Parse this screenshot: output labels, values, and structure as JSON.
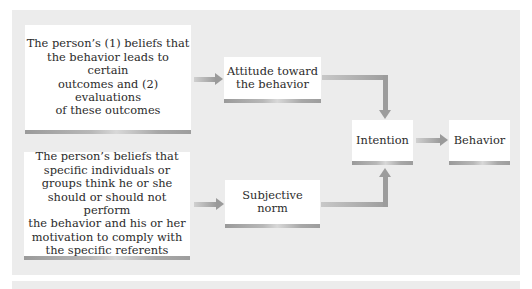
{
  "diagram": {
    "nodes": [
      {
        "id": "beliefs_outcomes",
        "label": "The person’s (1) beliefs that the behavior leads to certain outcomes and (2) evaluations of these outcomes"
      },
      {
        "id": "normative_beliefs",
        "label": "The person’s beliefs that specific individuals or groups think he or she should or should not perform the behavior and his or her motivation to comply with the specific referents"
      },
      {
        "id": "attitude",
        "label": "Attitude toward the behavior"
      },
      {
        "id": "subjective_norm",
        "label": "Subjective norm"
      },
      {
        "id": "intention",
        "label": "Intention"
      },
      {
        "id": "behavior",
        "label": "Behavior"
      }
    ],
    "edges": [
      {
        "from": "beliefs_outcomes",
        "to": "attitude"
      },
      {
        "from": "normative_beliefs",
        "to": "subjective_norm"
      },
      {
        "from": "attitude",
        "to": "intention"
      },
      {
        "from": "subjective_norm",
        "to": "intention"
      },
      {
        "from": "intention",
        "to": "behavior"
      }
    ]
  },
  "labels": {
    "box1": "The person’s (1) beliefs that the behavior leads to certain outcomes and (2) evaluations of these outcomes",
    "box1_lines": [
      "The person’s (1) beliefs that",
      "the behavior leads to certain",
      "outcomes and (2) evaluations",
      "of these outcomes"
    ],
    "box2_lines": [
      "The person’s beliefs that",
      "specific individuals or",
      "groups think he or she",
      "should or should not perform",
      "the behavior and his or her",
      "motivation to comply with",
      "the specific referents"
    ],
    "attitude_lines": [
      "Attitude toward",
      "the behavior"
    ],
    "norm_lines": [
      "Subjective",
      "norm"
    ],
    "intention": "Intention",
    "behavior": "Behavior"
  },
  "colors": {
    "panel_bg": "#ececec",
    "box_bg": "#ffffff",
    "arrow": "#9c9c9c",
    "text": "#2b2b2b"
  }
}
